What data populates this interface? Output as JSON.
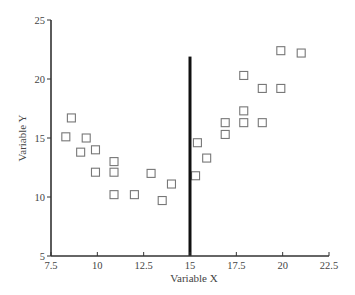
{
  "chart_data": {
    "type": "scatter",
    "title": "",
    "xlabel": "Variable X",
    "ylabel": "Variable Y",
    "xlim": [
      7.5,
      22.5
    ],
    "ylim": [
      5,
      25
    ],
    "x_ticks": [
      7.5,
      10,
      12.5,
      15,
      17.5,
      20,
      22.5
    ],
    "x_tick_labels": [
      "7.5",
      "10",
      "12.5",
      "15",
      "17.5",
      "20",
      "22.5"
    ],
    "y_ticks": [
      5,
      10,
      15,
      20,
      25
    ],
    "y_tick_labels": [
      "5",
      "10",
      "15",
      "20",
      "25"
    ],
    "grid": false,
    "legend": null,
    "marker": "open-square",
    "annotations": [
      {
        "type": "vline",
        "x": 15,
        "y_from": 5,
        "y_to": 21.9,
        "color": "#111111",
        "width": 3
      }
    ],
    "series": [
      {
        "name": "observations",
        "points": [
          {
            "x": 8.3,
            "y": 15.1
          },
          {
            "x": 8.6,
            "y": 16.7
          },
          {
            "x": 9.1,
            "y": 13.8
          },
          {
            "x": 9.4,
            "y": 15.0
          },
          {
            "x": 9.9,
            "y": 14.0
          },
          {
            "x": 9.9,
            "y": 12.1
          },
          {
            "x": 10.9,
            "y": 13.0
          },
          {
            "x": 10.9,
            "y": 12.1
          },
          {
            "x": 10.9,
            "y": 10.2
          },
          {
            "x": 12.0,
            "y": 10.2
          },
          {
            "x": 12.9,
            "y": 12.0
          },
          {
            "x": 13.5,
            "y": 9.7
          },
          {
            "x": 14.0,
            "y": 11.1
          },
          {
            "x": 15.3,
            "y": 11.8
          },
          {
            "x": 15.4,
            "y": 14.6
          },
          {
            "x": 15.9,
            "y": 13.3
          },
          {
            "x": 16.9,
            "y": 15.3
          },
          {
            "x": 16.9,
            "y": 16.3
          },
          {
            "x": 17.9,
            "y": 16.3
          },
          {
            "x": 17.9,
            "y": 17.3
          },
          {
            "x": 17.9,
            "y": 20.3
          },
          {
            "x": 18.9,
            "y": 16.3
          },
          {
            "x": 18.9,
            "y": 19.2
          },
          {
            "x": 19.9,
            "y": 19.2
          },
          {
            "x": 19.9,
            "y": 22.4
          },
          {
            "x": 21.0,
            "y": 22.2
          }
        ]
      }
    ]
  },
  "colors": {
    "axis": "#333333",
    "marker_stroke": "#777777",
    "vline": "#111111",
    "text": "#444444"
  }
}
